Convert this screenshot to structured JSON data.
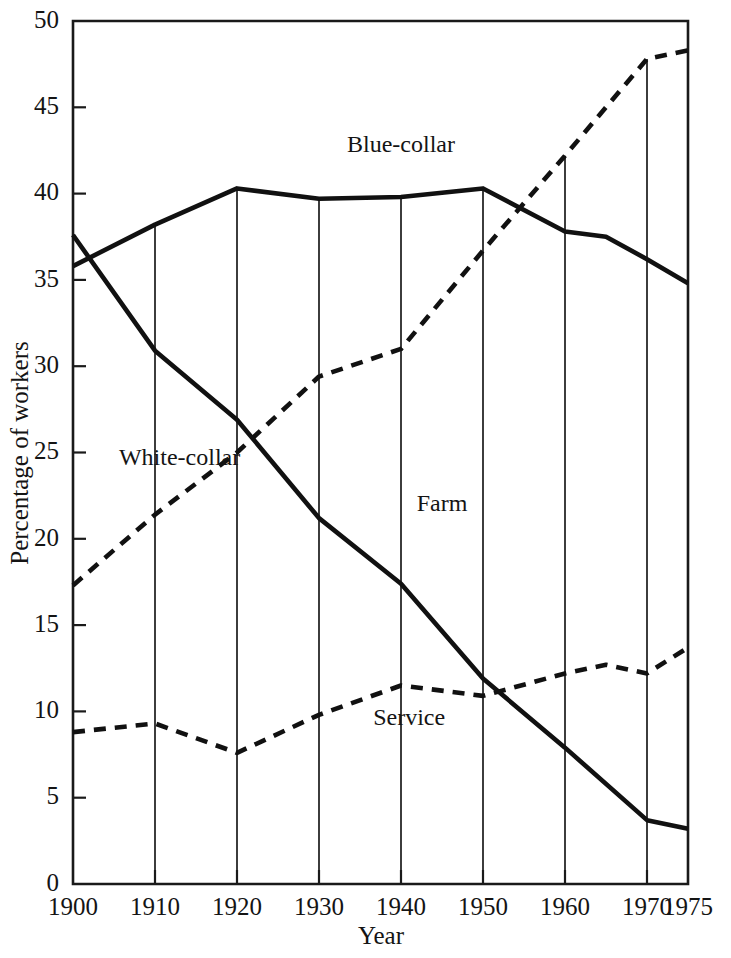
{
  "chart_data": {
    "type": "line",
    "title": "",
    "xlabel": "Year",
    "ylabel": "Percentage of workers",
    "xlim": [
      1900,
      1975
    ],
    "ylim": [
      0,
      50
    ],
    "grid": "vertical gridlines at each decade, drawn from the axis up to the uppermost series",
    "legend": "inline labels placed next to each curve",
    "x_ticks": [
      1900,
      1910,
      1920,
      1930,
      1940,
      1950,
      1960,
      1970,
      1975
    ],
    "x_tick_labels": [
      "1900",
      "1910",
      "1920",
      "1930",
      "1940",
      "1950",
      "1960",
      "1970",
      "1975"
    ],
    "y_ticks": [
      0,
      5,
      10,
      15,
      20,
      25,
      30,
      35,
      40,
      45,
      50
    ],
    "y_tick_labels": [
      "0",
      "5",
      "10",
      "15",
      "20",
      "25",
      "30",
      "35",
      "40",
      "45",
      "50"
    ],
    "series": [
      {
        "name": "Blue-collar",
        "style": "solid",
        "label_x": 1940,
        "label_y": 42.4,
        "x": [
          1900,
          1910,
          1920,
          1930,
          1940,
          1950,
          1960,
          1965,
          1970,
          1975
        ],
        "values": [
          35.8,
          38.2,
          40.3,
          39.7,
          39.8,
          40.3,
          37.8,
          37.5,
          36.2,
          34.8
        ]
      },
      {
        "name": "White-collar",
        "style": "dashed",
        "label_x": 1913,
        "label_y": 24.3,
        "x": [
          1900,
          1910,
          1920,
          1930,
          1940,
          1950,
          1960,
          1970,
          1975
        ],
        "values": [
          17.3,
          21.4,
          25.0,
          29.4,
          31.0,
          36.7,
          42.2,
          47.8,
          48.3
        ]
      },
      {
        "name": "Farm",
        "style": "solid",
        "label_x": 1945,
        "label_y": 21.6,
        "x": [
          1900,
          1910,
          1920,
          1930,
          1940,
          1950,
          1960,
          1970,
          1975
        ],
        "values": [
          37.6,
          30.9,
          26.9,
          21.2,
          17.4,
          11.9,
          7.9,
          3.7,
          3.2
        ]
      },
      {
        "name": "Service",
        "style": "dashed",
        "label_x": 1941,
        "label_y": 9.2,
        "x": [
          1900,
          1910,
          1920,
          1930,
          1940,
          1950,
          1960,
          1965,
          1970,
          1975
        ],
        "values": [
          8.8,
          9.3,
          7.6,
          9.8,
          11.5,
          10.9,
          12.2,
          12.7,
          12.2,
          13.7
        ]
      }
    ],
    "gridline_tops": {
      "1910": 38.2,
      "1920": 40.3,
      "1930": 39.7,
      "1940": 39.8,
      "1950": 40.3,
      "1960": 42.2,
      "1970": 47.8
    }
  },
  "axis": {
    "y_title": "Percentage of workers",
    "x_title": "Year"
  }
}
